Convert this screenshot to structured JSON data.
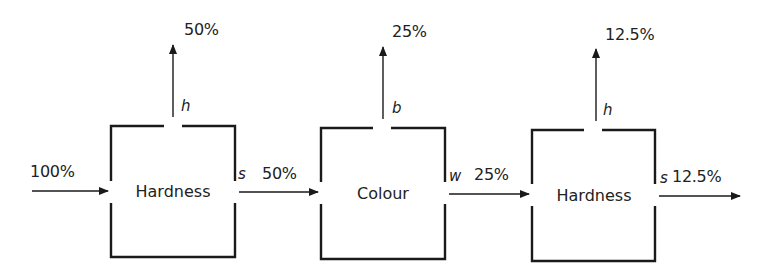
{
  "diagram": {
    "type": "separation-flow",
    "input": {
      "label": "100%"
    },
    "stages": [
      {
        "name": "Hardness",
        "top_stream": "h",
        "top_output": "50%",
        "side_stream": "s",
        "side_output": "50%"
      },
      {
        "name": "Colour",
        "top_stream": "b",
        "top_output": "25%",
        "side_stream": "w",
        "side_output": "25%"
      },
      {
        "name": "Hardness",
        "top_stream": "h",
        "top_output": "12.5%",
        "side_stream": "s",
        "side_output": "12.5%"
      }
    ],
    "colors": {
      "line": "#1a1a1a",
      "background": "#ffffff"
    }
  }
}
